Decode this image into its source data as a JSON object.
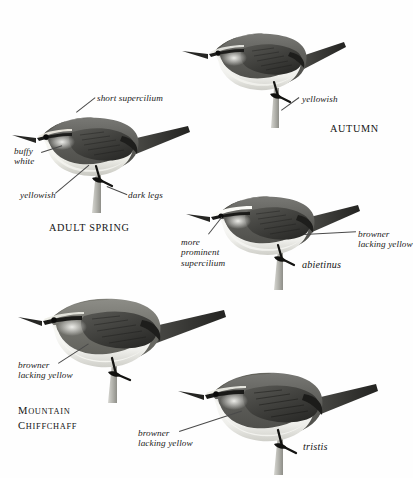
{
  "plate": {
    "title": "Chiffchaff plumage and race plate",
    "background": "#ffffff",
    "ink": "#1a1a1a"
  },
  "figures": [
    {
      "id": "adult-spring",
      "caption": "ADULT SPRING",
      "labels": [
        "short supercilium",
        "buffy\nwhite",
        "yellowish",
        "dark legs"
      ]
    },
    {
      "id": "autumn",
      "caption": "AUTUMN",
      "labels": [
        "yellowish"
      ]
    },
    {
      "id": "abietinus",
      "caption": "abietinus",
      "labels": [
        "more\nprominent\nsupercilium",
        "browner\nlacking yellow"
      ]
    },
    {
      "id": "mountain-chiffchaff",
      "caption": "MOUNTAIN\nCHIFFCHAFF",
      "labels": [
        "browner\nlacking yellow"
      ]
    },
    {
      "id": "tristis",
      "caption": "tristis",
      "labels": [
        "browner\nlacking yellow"
      ]
    }
  ],
  "labels": {
    "short_supercilium": "short supercilium",
    "buffy_white": "buffy\nwhite",
    "yellowish_spring": "yellowish",
    "dark_legs": "dark legs",
    "yellowish_autumn": "yellowish",
    "more_prominent_supercilium": "more\nprominent\nsupercilium",
    "browner_lacking_yellow_abietinus": "browner\nlacking yellow",
    "browner_lacking_yellow_mountain": "browner\nlacking yellow",
    "browner_lacking_yellow_tristis": "browner\nlacking yellow"
  },
  "captions": {
    "adult_spring": "ADULT SPRING",
    "autumn": "AUTUMN",
    "abietinus": "abietinus",
    "mountain_line1": "M",
    "mountain_line1_rest": "OUNTAIN",
    "mountain_line2": "C",
    "mountain_line2_rest": "HIFFCHAFF",
    "tristis": "tristis"
  },
  "colors": {
    "upperparts_dark": "#4c4c4c",
    "upperparts_mid": "#6e6e6e",
    "underparts_pale": "#e8e8e4",
    "underparts_shadow": "#c9c9c4",
    "wing_dark": "#2e2e2e",
    "bill_dark": "#1f1f1f",
    "leg_dark": "#161616",
    "twig_pale": "#bdbdb8",
    "leader_line": "#4a4a4a"
  }
}
